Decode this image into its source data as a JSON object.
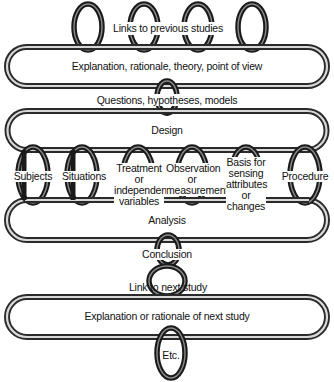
{
  "diagram": {
    "top_label": "Links to previous studies",
    "band_explanation": "Explanation, rationale, theory, point of view",
    "link_questions": "Questions, hypotheses, models",
    "band_design": "Design",
    "design_components": [
      {
        "label": "Subjects"
      },
      {
        "label": "Situations"
      },
      {
        "label": "Treatment or independent variables"
      },
      {
        "label": "Observation or measurement"
      },
      {
        "label": "Basis for sensing attributes or changes"
      },
      {
        "label": "Procedure"
      }
    ],
    "band_analysis": "Analysis",
    "link_conclusion": "Conclusion",
    "link_next_study": "Link to next study",
    "band_next_explanation": "Explanation or rationale of next study",
    "link_etc": "Etc."
  },
  "colors": {
    "ring": "#1a1a1a",
    "band": "#2a2a2a",
    "highlight": "#d8d8d8",
    "background": "#ffffff",
    "text": "#111111"
  }
}
